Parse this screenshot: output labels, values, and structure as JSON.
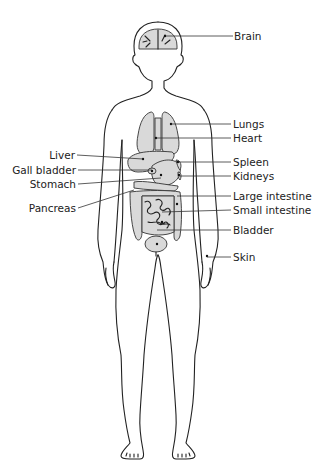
{
  "diagram": {
    "labels_right": [
      {
        "id": "brain",
        "text": "Brain"
      },
      {
        "id": "lungs",
        "text": "Lungs"
      },
      {
        "id": "heart",
        "text": "Heart"
      },
      {
        "id": "spleen",
        "text": "Spleen"
      },
      {
        "id": "kidneys",
        "text": "Kidneys"
      },
      {
        "id": "large-intestine",
        "text": "Large intestine"
      },
      {
        "id": "small-intestine",
        "text": "Small intestine"
      },
      {
        "id": "bladder",
        "text": "Bladder"
      },
      {
        "id": "skin",
        "text": "Skin"
      }
    ],
    "labels_left": [
      {
        "id": "liver",
        "text": "Liver"
      },
      {
        "id": "gall-bladder",
        "text": "Gall bladder"
      },
      {
        "id": "stomach",
        "text": "Stomach"
      },
      {
        "id": "pancreas",
        "text": "Pancreas"
      }
    ],
    "colors": {
      "outline": "#222222",
      "organ_fill": "#d9d9d9",
      "background": "#ffffff"
    }
  }
}
